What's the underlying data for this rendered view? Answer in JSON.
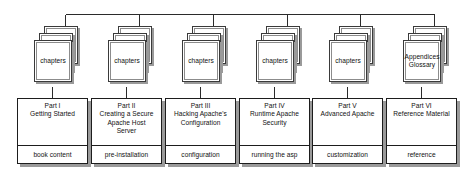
{
  "diagram": {
    "accent_color": "#1d1d1d",
    "shadow_color": "#9a9a9a",
    "background": "#ffffff",
    "stack_card_count": 3,
    "columns": [
      {
        "stack_label": "chapters",
        "part_number": "Part I",
        "part_title": "Getting Started",
        "tag": "book content"
      },
      {
        "stack_label": "chapters",
        "part_number": "Part II",
        "part_title": "Creating a Secure\nApache Host\nServer",
        "tag": "pre-installation"
      },
      {
        "stack_label": "chapters",
        "part_number": "Part III",
        "part_title": "Hacking Apache's\nConfiguration",
        "tag": "configuration"
      },
      {
        "stack_label": "chapters",
        "part_number": "Part IV",
        "part_title": "Runtime Apache\nSecurity",
        "tag": "running the asp"
      },
      {
        "stack_label": "chapters",
        "part_number": "Part V",
        "part_title": "Advanced Apache",
        "tag": "customization"
      },
      {
        "stack_label": "Appendices\nGlossary",
        "part_number": "Part VI",
        "part_title": "Reference Material",
        "tag": "reference"
      }
    ]
  }
}
